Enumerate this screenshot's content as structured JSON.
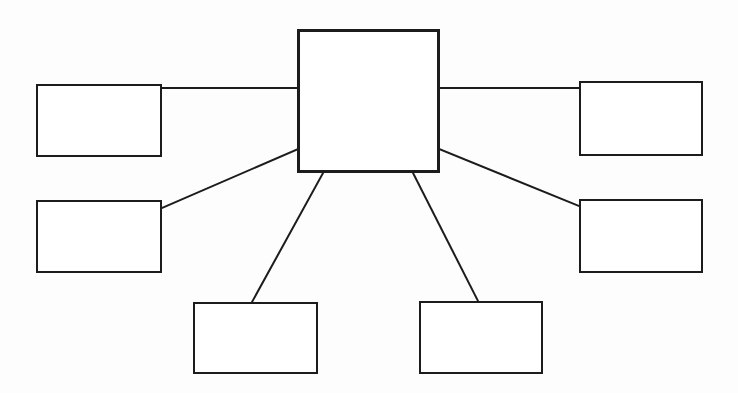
{
  "document": {
    "title": "Blank Concept Map",
    "type": "hierarchical-node-diagram",
    "background_color": "#fdfdfd",
    "line_color": "#1c1c1c",
    "box_fill_color": "#ffffff"
  },
  "diagram": {
    "central_node": {
      "id": "central",
      "label": "",
      "x": 297,
      "y": 29,
      "width": 143,
      "height": 144
    },
    "nodes": [
      {
        "id": "node-top-left",
        "label": "",
        "x": 36,
        "y": 84,
        "width": 126,
        "height": 73,
        "position": "top-left"
      },
      {
        "id": "node-middle-left",
        "label": "",
        "x": 36,
        "y": 200,
        "width": 126,
        "height": 73,
        "position": "middle-left"
      },
      {
        "id": "node-bottom-left",
        "label": "",
        "x": 193,
        "y": 302,
        "width": 125,
        "height": 72,
        "position": "bottom-left"
      },
      {
        "id": "node-bottom-right",
        "label": "",
        "x": 419,
        "y": 301,
        "width": 124,
        "height": 73,
        "position": "bottom-right"
      },
      {
        "id": "node-middle-right",
        "label": "",
        "x": 579,
        "y": 199,
        "width": 124,
        "height": 74,
        "position": "middle-right"
      },
      {
        "id": "node-top-right",
        "label": "",
        "x": 579,
        "y": 81,
        "width": 124,
        "height": 75,
        "position": "top-right"
      }
    ],
    "connectors": [
      {
        "id": "connector-central-to-top-left",
        "from": "central",
        "to": "node-top-left",
        "x1": 297,
        "y1": 88,
        "x2": 162,
        "y2": 88,
        "style": "straight-horizontal"
      },
      {
        "id": "connector-central-to-top-right",
        "from": "central",
        "to": "node-top-right",
        "x1": 440,
        "y1": 88,
        "x2": 579,
        "y2": 88,
        "style": "straight-horizontal"
      },
      {
        "id": "connector-central-to-middle-left",
        "from": "central",
        "to": "node-middle-left",
        "x1": 298,
        "y1": 149,
        "x2": 162,
        "y2": 208,
        "style": "diagonal"
      },
      {
        "id": "connector-central-to-middle-right",
        "from": "central",
        "to": "node-middle-right",
        "x1": 439,
        "y1": 149,
        "x2": 579,
        "y2": 206,
        "style": "diagonal"
      },
      {
        "id": "connector-central-to-bottom-left",
        "from": "central",
        "to": "node-bottom-left",
        "x1": 323,
        "y1": 173,
        "x2": 252,
        "y2": 302,
        "style": "diagonal"
      },
      {
        "id": "connector-central-to-bottom-right",
        "from": "central",
        "to": "node-bottom-right",
        "x1": 413,
        "y1": 173,
        "x2": 478,
        "y2": 301,
        "style": "diagonal"
      }
    ]
  }
}
